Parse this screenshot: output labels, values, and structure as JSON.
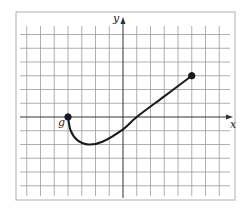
{
  "chart_data": {
    "type": "line",
    "title": "",
    "xlabel": "x",
    "ylabel": "y",
    "xlim": [
      -7,
      7
    ],
    "ylim": [
      -5,
      6
    ],
    "grid": true,
    "grid_step": 1,
    "series": [
      {
        "name": "g",
        "label": "g",
        "points": [
          {
            "x": -4,
            "y": 0
          },
          {
            "x": -3.8,
            "y": -1
          },
          {
            "x": -3.3,
            "y": -1.7
          },
          {
            "x": -2.5,
            "y": -2
          },
          {
            "x": -1.5,
            "y": -1.8
          },
          {
            "x": 0,
            "y": -0.9
          },
          {
            "x": 1,
            "y": 0
          },
          {
            "x": 3,
            "y": 1.5
          },
          {
            "x": 5,
            "y": 3
          }
        ],
        "endpoints": [
          {
            "x": -4,
            "y": 0,
            "closed": true
          },
          {
            "x": 5,
            "y": 3,
            "closed": true
          }
        ]
      }
    ]
  },
  "labels": {
    "x_axis": "x",
    "y_axis": "y",
    "function": "g"
  },
  "colors": {
    "grid": "#9a9a9a",
    "axis": "#333333",
    "curve": "#1a1a1a",
    "frame": "#b0b0b0"
  }
}
